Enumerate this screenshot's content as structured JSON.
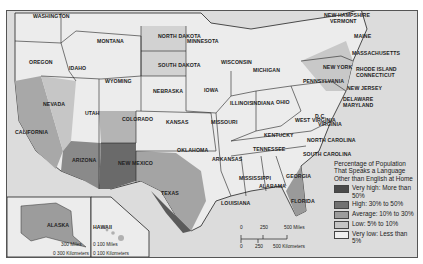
{
  "map": {
    "title": "Percentage of Population That Speaks a Language Other than English at Home",
    "states": [
      {
        "name": "WASHINGTON",
        "x": 30,
        "y": 12
      },
      {
        "name": "OREGON",
        "x": 28,
        "y": 58
      },
      {
        "name": "IDAHO",
        "x": 68,
        "y": 64
      },
      {
        "name": "MONTANA",
        "x": 96,
        "y": 37
      },
      {
        "name": "WYOMING",
        "x": 104,
        "y": 77
      },
      {
        "name": "NORTH DAKOTA",
        "x": 157,
        "y": 32
      },
      {
        "name": "SOUTH DAKOTA",
        "x": 157,
        "y": 61
      },
      {
        "name": "MINNESOTA",
        "x": 186,
        "y": 37
      },
      {
        "name": "WISCONSIN",
        "x": 220,
        "y": 58
      },
      {
        "name": "MICHIGAN",
        "x": 252,
        "y": 66
      },
      {
        "name": "NEBRASKA",
        "x": 152,
        "y": 87
      },
      {
        "name": "IOWA",
        "x": 203,
        "y": 86
      },
      {
        "name": "ILLINOIS",
        "x": 229,
        "y": 99
      },
      {
        "name": "INDIANA",
        "x": 251,
        "y": 99
      },
      {
        "name": "OHIO",
        "x": 275,
        "y": 98
      },
      {
        "name": "PENNSYLVANIA",
        "x": 302,
        "y": 77
      },
      {
        "name": "NEW YORK",
        "x": 322,
        "y": 63
      },
      {
        "name": "NEVADA",
        "x": 42,
        "y": 100
      },
      {
        "name": "UTAH",
        "x": 84,
        "y": 109
      },
      {
        "name": "COLORADO",
        "x": 121,
        "y": 115
      },
      {
        "name": "KANSAS",
        "x": 165,
        "y": 118
      },
      {
        "name": "MISSOURI",
        "x": 210,
        "y": 118
      },
      {
        "name": "KENTUCKY",
        "x": 263,
        "y": 131
      },
      {
        "name": "WEST VIRGINIA",
        "x": 294,
        "y": 116
      },
      {
        "name": "VIRGINIA",
        "x": 317,
        "y": 120
      },
      {
        "name": "CALIFORNIA",
        "x": 14,
        "y": 128
      },
      {
        "name": "ARIZONA",
        "x": 71,
        "y": 156
      },
      {
        "name": "NEW MEXICO",
        "x": 117,
        "y": 159
      },
      {
        "name": "OKLAHOMA",
        "x": 176,
        "y": 146
      },
      {
        "name": "ARKANSAS",
        "x": 211,
        "y": 155
      },
      {
        "name": "TENNESSEE",
        "x": 252,
        "y": 145
      },
      {
        "name": "NORTH CAROLINA",
        "x": 306,
        "y": 136
      },
      {
        "name": "SOUTH CAROLINA",
        "x": 302,
        "y": 150
      },
      {
        "name": "MISSISSIPPI",
        "x": 238,
        "y": 174
      },
      {
        "name": "ALABAMA",
        "x": 258,
        "y": 182
      },
      {
        "name": "GEORGIA",
        "x": 285,
        "y": 172
      },
      {
        "name": "TEXAS",
        "x": 160,
        "y": 189
      },
      {
        "name": "LOUISIANA",
        "x": 220,
        "y": 199
      },
      {
        "name": "FLORIDA",
        "x": 290,
        "y": 197
      },
      {
        "name": "NEW HAMPSHIRE",
        "x": 323,
        "y": 11
      },
      {
        "name": "VERMONT",
        "x": 329,
        "y": 17
      },
      {
        "name": "MAINE",
        "x": 353,
        "y": 32
      },
      {
        "name": "MASSACHUSETTS",
        "x": 351,
        "y": 49
      },
      {
        "name": "RHODE ISLAND",
        "x": 355,
        "y": 65
      },
      {
        "name": "CONNECTICUT",
        "x": 355,
        "y": 71
      },
      {
        "name": "NEW JERSEY",
        "x": 346,
        "y": 84
      },
      {
        "name": "DELAWARE",
        "x": 342,
        "y": 95
      },
      {
        "name": "MARYLAND",
        "x": 342,
        "y": 101
      },
      {
        "name": "D.C.",
        "x": 314,
        "y": 102
      },
      {
        "name": "ALASKA",
        "x": 38,
        "y": 211
      },
      {
        "name": "HAWAII",
        "x": 92,
        "y": 223
      }
    ],
    "scale_main": {
      "miles": [
        "0",
        "250",
        "500 Miles"
      ],
      "km": [
        "0",
        "250",
        "500 Kilometers"
      ]
    },
    "scale_alaska": {
      "miles": "300 Miles",
      "km": "0  300 Kilometers"
    },
    "scale_hawaii": {
      "miles": "0   100 Miles",
      "km": "0  100 Kilometers"
    }
  },
  "legend": {
    "title": "Percentage of Population That Speaks a Language Other than English at Home",
    "items": [
      {
        "label": "Very high: More than 50%",
        "color": "#4a4a4a"
      },
      {
        "label": "High: 30% to 50%",
        "color": "#727272"
      },
      {
        "label": "Average: 10% to 30%",
        "color": "#9c9c9c"
      },
      {
        "label": "Low: 5% to 10%",
        "color": "#c4c4c4"
      },
      {
        "label": "Very low: Less than 5%",
        "color": "#efefef"
      }
    ]
  }
}
